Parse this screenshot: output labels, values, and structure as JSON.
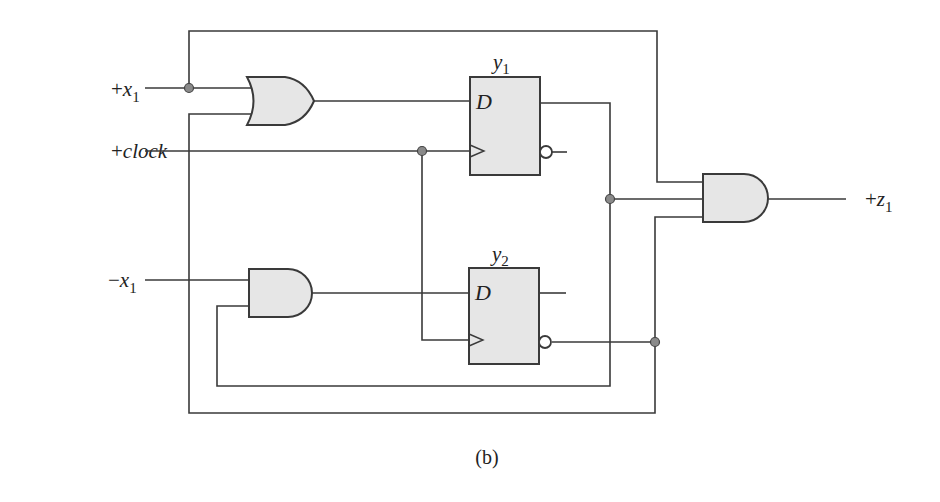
{
  "diagram": {
    "type": "sequential-logic-circuit",
    "caption": "(b)",
    "inputs": [
      {
        "sign": "+",
        "name": "x",
        "sub": "1"
      },
      {
        "sign": "+",
        "name": "clock",
        "sub": ""
      },
      {
        "sign": "−",
        "name": "x",
        "sub": "1"
      }
    ],
    "output": {
      "sign": "+",
      "name": "z",
      "sub": "1"
    },
    "flip_flops": [
      {
        "name": "y",
        "sub": "1",
        "type": "D",
        "d_label": "D"
      },
      {
        "name": "y",
        "sub": "2",
        "type": "D",
        "d_label": "D"
      }
    ],
    "gates": [
      {
        "id": "or1",
        "type": "OR",
        "inputs": [
          "+x1",
          "y2'"
        ],
        "output": "D of y1"
      },
      {
        "id": "and1",
        "type": "AND",
        "inputs": [
          "-x1",
          "y1"
        ],
        "output": "D of y2"
      },
      {
        "id": "and2",
        "type": "AND",
        "inputs": [
          "+x1",
          "y1",
          "y2'"
        ],
        "output": "+z1"
      }
    ],
    "colors": {
      "wire": "#3a3a3a",
      "gate_fill": "#e6e6e6",
      "junction": "#8a8a8a"
    }
  }
}
